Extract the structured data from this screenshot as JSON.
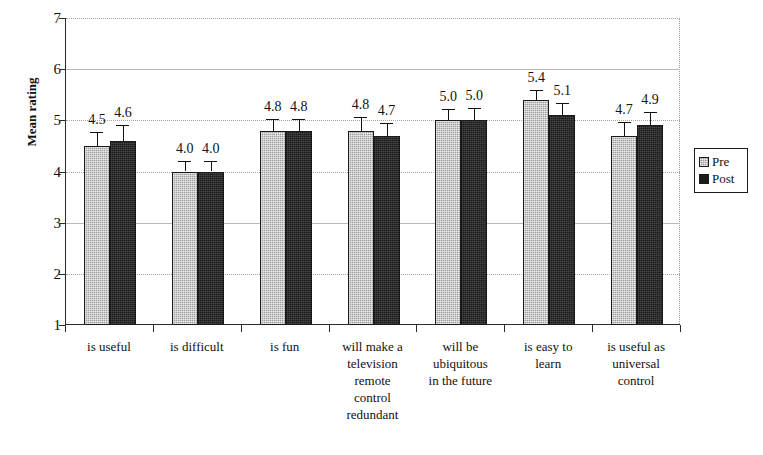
{
  "chart_data": {
    "type": "bar",
    "title": "",
    "xlabel": "",
    "ylabel": "Mean rating",
    "ylim": [
      1,
      7
    ],
    "yticks": [
      1,
      2,
      3,
      4,
      5,
      6,
      7
    ],
    "ytick_labels": [
      "1",
      "2",
      "3",
      "4",
      "5",
      "6",
      "7"
    ],
    "grid": "horizontal",
    "legend_position": "right",
    "categories": [
      "is useful",
      "is difficult",
      "is fun",
      "will make a television remote control redundant",
      "will be ubiquitous in the future",
      "is easy to learn",
      "is useful as universal control"
    ],
    "category_lines": [
      [
        "is useful"
      ],
      [
        "is difficult"
      ],
      [
        "is fun"
      ],
      [
        "will make a",
        "television",
        "remote",
        "control",
        "redundant"
      ],
      [
        "will be",
        "ubiquitous",
        "in the future"
      ],
      [
        "is easy to",
        "learn"
      ],
      [
        "is useful as",
        "universal",
        "control"
      ]
    ],
    "series": [
      {
        "name": "Pre",
        "color": "#9d9d9d",
        "values": [
          4.5,
          4.0,
          4.8,
          4.8,
          5.0,
          5.4,
          4.7
        ],
        "labels": [
          "4.5",
          "4.0",
          "4.8",
          "4.8",
          "5.0",
          "5.4",
          "4.7"
        ],
        "errors": [
          0.27,
          0.21,
          0.22,
          0.27,
          0.23,
          0.2,
          0.26
        ]
      },
      {
        "name": "Post",
        "color": "#1c1c1c",
        "values": [
          4.6,
          4.0,
          4.8,
          4.7,
          5.0,
          5.1,
          4.9
        ],
        "labels": [
          "4.6",
          "4.0",
          "4.8",
          "4.7",
          "5.0",
          "5.1",
          "4.9"
        ],
        "errors": [
          0.3,
          0.21,
          0.22,
          0.25,
          0.24,
          0.24,
          0.26
        ]
      }
    ]
  },
  "legend": {
    "items": [
      {
        "label": "Pre"
      },
      {
        "label": "Post"
      }
    ]
  },
  "axis": {
    "y_title": "Mean rating"
  }
}
